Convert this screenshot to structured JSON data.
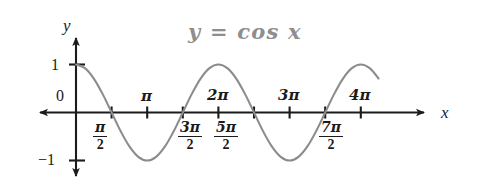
{
  "figure": {
    "title": "y = cos x",
    "title_color": "#8e8e8e",
    "curve_color": "#8c8c8c",
    "axis_color": "#1b1b1b",
    "background": "#ffffff",
    "width": 489,
    "height": 184
  },
  "axes": {
    "x_axis_label": "x",
    "y_axis_label": "y",
    "y_ticks": [
      {
        "label": "1",
        "value": 1
      },
      {
        "label": "0",
        "value": 0
      },
      {
        "label": "−1",
        "value": -1
      }
    ],
    "x_ticks_above": [
      {
        "label": "π",
        "value": 3.14159
      },
      {
        "label": "2π",
        "value": 6.28319
      },
      {
        "label": "3π",
        "value": 9.42478
      },
      {
        "label": "4π",
        "value": 12.56637
      }
    ],
    "x_ticks_below": [
      {
        "numerator": "π",
        "denominator": "2",
        "value": 1.5708
      },
      {
        "numerator": "3π",
        "denominator": "2",
        "value": 4.71239
      },
      {
        "numerator": "5π",
        "denominator": "2",
        "value": 7.85398
      },
      {
        "numerator": "7π",
        "denominator": "2",
        "value": 14.13717
      }
    ]
  },
  "chart_data": {
    "type": "line",
    "title": "y = cos x",
    "xlabel": "x",
    "ylabel": "y",
    "function": "y = cos x",
    "xlim": [
      -0.45,
      13.6
    ],
    "ylim": [
      -1.35,
      1.35
    ],
    "grid": false,
    "legend": false,
    "x_tick_labels": [
      "π/2",
      "π",
      "3π/2",
      "2π",
      "5π/2",
      "3π",
      "7π/2",
      "4π"
    ],
    "x_tick_values": [
      1.5708,
      3.14159,
      4.71239,
      6.28319,
      7.85398,
      9.42478,
      10.99557,
      12.56637
    ],
    "y_tick_labels": [
      "1",
      "0",
      "−1"
    ],
    "y_tick_values": [
      1,
      0,
      -1
    ],
    "series": [
      {
        "name": "cos x",
        "x": [
          0,
          0.3927,
          0.7854,
          1.1781,
          1.5708,
          1.9635,
          2.3562,
          2.7489,
          3.1416,
          3.5343,
          3.927,
          4.3197,
          4.7124,
          5.1051,
          5.4978,
          5.8905,
          6.2832,
          6.6759,
          7.0686,
          7.4613,
          7.854,
          8.2467,
          8.6394,
          9.0321,
          9.4248,
          9.8175,
          10.2102,
          10.6029,
          10.9956,
          11.3883,
          11.781,
          12.1737,
          12.5664,
          12.9591,
          13.3518
        ],
        "y": [
          1,
          0.9239,
          0.7071,
          0.3827,
          0,
          -0.3827,
          -0.7071,
          -0.9239,
          -1,
          -0.9239,
          -0.7071,
          -0.3827,
          0,
          0.3827,
          0.7071,
          0.9239,
          1,
          0.9239,
          0.7071,
          0.3827,
          0,
          -0.3827,
          -0.7071,
          -0.9239,
          -1,
          -0.9239,
          -0.7071,
          -0.3827,
          0,
          0.3827,
          0.7071,
          0.9239,
          1,
          0.9239,
          0.7071
        ]
      }
    ],
    "annotations": [
      {
        "text": "y = cos x",
        "x": 5.1,
        "y": 1.28
      }
    ]
  }
}
